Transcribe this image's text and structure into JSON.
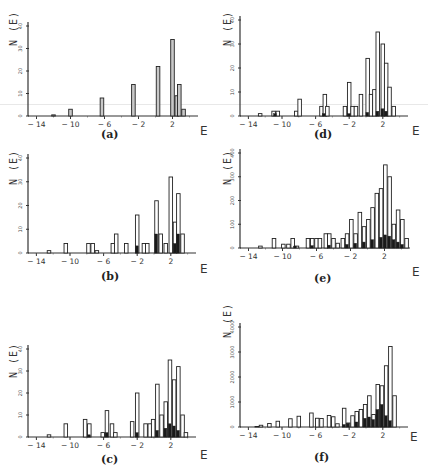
{
  "figure": {
    "y_axis_label": "N (E)",
    "x_axis_label": "E",
    "x_ticks": [
      "-14",
      "-10",
      "-6",
      "-2",
      "2"
    ]
  },
  "chart_data": [
    {
      "id": "a",
      "type": "bar",
      "caption": "(a)",
      "title": "",
      "xlabel": "E",
      "ylabel": "N (E)",
      "xlim": [
        -15,
        5
      ],
      "ylim": [
        0,
        40
      ],
      "y_ticks": [
        0,
        10,
        20,
        30,
        40
      ],
      "x_ticks": [
        -14,
        -10,
        -6,
        -2,
        2
      ],
      "series": [
        {
          "name": "total",
          "x": [
            -12,
            -10,
            -6.3,
            -2.6,
            0.3,
            2,
            2.5,
            2.8,
            3.3
          ],
          "values": [
            0.5,
            3,
            8,
            14,
            22,
            34,
            9,
            14,
            3
          ]
        }
      ]
    },
    {
      "id": "d",
      "type": "bar",
      "caption": "(d)",
      "title": "",
      "xlabel": "E",
      "ylabel": "N (E)",
      "xlim": [
        -15,
        5
      ],
      "ylim": [
        0,
        40
      ],
      "y_ticks": [
        0,
        10,
        20,
        30,
        40
      ],
      "x_ticks": [
        -14,
        -10,
        -6,
        -2,
        2
      ],
      "series": [
        {
          "name": "total",
          "x": [
            -12.6,
            -11.0,
            -10.5,
            -8.3,
            -7.9,
            -5.3,
            -4.9,
            -4.6,
            -2.5,
            -2.0,
            -1.6,
            -1.2,
            -0.6,
            0.2,
            0.6,
            1.0,
            1.4,
            2.0,
            2.4,
            2.8,
            3.3,
            3.8
          ],
          "values": [
            1,
            2,
            2,
            2,
            7,
            4,
            9,
            4,
            4,
            14,
            4,
            4,
            9,
            24,
            9,
            11,
            35,
            30,
            22,
            12,
            4,
            0
          ]
        },
        {
          "name": "filled",
          "x": [
            -10.8,
            -5.0,
            -2.0,
            0.2,
            1.4,
            2.0,
            2.4
          ],
          "values": [
            1,
            1,
            1,
            1.5,
            2,
            3,
            2
          ]
        }
      ]
    },
    {
      "id": "b",
      "type": "bar",
      "caption": "(b)",
      "title": "",
      "xlabel": "E",
      "ylabel": "N (E)",
      "xlim": [
        -15,
        5
      ],
      "ylim": [
        0,
        40
      ],
      "y_ticks": [
        0,
        10,
        20,
        30,
        40
      ],
      "x_ticks": [
        -14,
        -10,
        -6,
        -2,
        2
      ],
      "series": [
        {
          "name": "total",
          "x": [
            -12.5,
            -10.5,
            -7.8,
            -7.3,
            -6.8,
            -4.9,
            -4.5,
            -3.3,
            -2.0,
            -1.2,
            -0.8,
            0.3,
            0.8,
            1.4,
            2.0,
            2.5,
            2.9,
            3.4
          ],
          "values": [
            1,
            4,
            4,
            4,
            1,
            4,
            8,
            4,
            16,
            4,
            4,
            22,
            8,
            4,
            32,
            13,
            25,
            8
          ]
        },
        {
          "name": "filled",
          "x": [
            -2.0,
            0.3,
            2.5,
            2.9
          ],
          "values": [
            3,
            8,
            4,
            8
          ]
        }
      ]
    },
    {
      "id": "e",
      "type": "bar",
      "caption": "(e)",
      "title": "",
      "xlabel": "E",
      "ylabel": "N (E)",
      "xlim": [
        -15,
        5
      ],
      "ylim": [
        0,
        400
      ],
      "y_ticks": [
        0,
        100,
        200,
        300,
        400
      ],
      "x_ticks": [
        -14,
        -10,
        -6,
        -2,
        2
      ],
      "series": [
        {
          "name": "total",
          "x": [
            -12.6,
            -11.0,
            -9.9,
            -9.3,
            -8.8,
            -8.3,
            -7.0,
            -6.5,
            -6.0,
            -5.6,
            -4.9,
            -4.5,
            -4.0,
            -3.5,
            -2.9,
            -2.4,
            -1.9,
            -1.4,
            -0.9,
            -0.4,
            0.1,
            0.6,
            1.1,
            1.6,
            2.1,
            2.6,
            3.1,
            3.6,
            4.1,
            4.6
          ],
          "values": [
            8,
            40,
            16,
            16,
            40,
            8,
            40,
            40,
            40,
            40,
            60,
            60,
            40,
            20,
            40,
            60,
            120,
            60,
            150,
            90,
            120,
            170,
            230,
            250,
            350,
            300,
            100,
            160,
            120,
            40
          ]
        },
        {
          "name": "filled",
          "x": [
            -8.5,
            -6.5,
            -4.5,
            -2.4,
            -1.4,
            -0.4,
            0.6,
            1.6,
            2.1,
            2.6,
            3.1,
            3.6,
            4.1
          ],
          "values": [
            8,
            10,
            12,
            15,
            20,
            25,
            35,
            45,
            55,
            50,
            35,
            25,
            15
          ]
        }
      ]
    },
    {
      "id": "c",
      "type": "bar",
      "caption": "(c)",
      "title": "",
      "xlabel": "E",
      "ylabel": "N (E)",
      "xlim": [
        -15,
        5
      ],
      "ylim": [
        0,
        40
      ],
      "y_ticks": [
        0,
        10,
        20,
        30,
        40
      ],
      "x_ticks": [
        -14,
        -10,
        -6,
        -2,
        2
      ],
      "series": [
        {
          "name": "total",
          "x": [
            -12.5,
            -10.5,
            -8.2,
            -7.7,
            -6.1,
            -5.6,
            -5.0,
            -4.6,
            -2.6,
            -2.0,
            -1.0,
            -0.5,
            -0.1,
            0.4,
            0.9,
            1.4,
            1.9,
            2.4,
            2.9,
            3.4,
            3.8
          ],
          "values": [
            1,
            6,
            8,
            6,
            2,
            12,
            6,
            2,
            7,
            20,
            6,
            6,
            8,
            24,
            10,
            16,
            35,
            26,
            32,
            10,
            2
          ]
        },
        {
          "name": "filled",
          "x": [
            -7.7,
            -5.6,
            -2.0,
            0.4,
            1.4,
            1.9,
            2.4,
            2.9
          ],
          "values": [
            1,
            2,
            2,
            3,
            4,
            6,
            5,
            3
          ]
        }
      ]
    },
    {
      "id": "f",
      "type": "bar",
      "caption": "(f)",
      "title": "",
      "xlabel": "E",
      "ylabel": "N (E)",
      "xlim": [
        -15,
        5
      ],
      "ylim": [
        0,
        4000
      ],
      "y_ticks": [
        0,
        1000,
        2000,
        3000,
        4000
      ],
      "x_ticks": [
        -14,
        -10,
        -6,
        -2,
        2
      ],
      "series": [
        {
          "name": "total",
          "x": [
            -13.0,
            -12.5,
            -11.5,
            -10.5,
            -9.0,
            -8.0,
            -6.5,
            -5.8,
            -5.3,
            -4.4,
            -3.9,
            -3.4,
            -2.6,
            -2.1,
            -1.6,
            -1.1,
            -0.6,
            -0.1,
            0.4,
            0.9,
            1.4,
            1.9,
            2.4,
            2.9,
            3.4
          ],
          "values": [
            20,
            70,
            140,
            230,
            330,
            430,
            560,
            350,
            340,
            460,
            410,
            130,
            750,
            160,
            450,
            620,
            700,
            900,
            1250,
            500,
            1700,
            1650,
            2450,
            3220,
            1250
          ]
        },
        {
          "name": "filled",
          "x": [
            -2.6,
            -2.1,
            -1.1,
            -0.1,
            0.4,
            0.9,
            1.4,
            1.9,
            2.4,
            2.9
          ],
          "values": [
            100,
            150,
            200,
            350,
            400,
            300,
            700,
            900,
            450,
            250
          ]
        }
      ]
    }
  ]
}
